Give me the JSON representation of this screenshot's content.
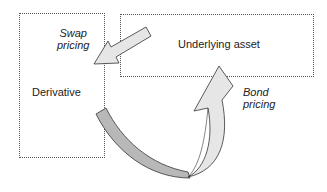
{
  "diagram": {
    "nodes": [
      {
        "id": "derivative",
        "label": "Derivative"
      },
      {
        "id": "underlying",
        "label": "Underlying asset"
      }
    ],
    "edges": [
      {
        "from": "underlying",
        "to": "derivative",
        "label_line1": "Swap",
        "label_line2": "pricing"
      },
      {
        "from": "derivative",
        "to": "underlying",
        "label_line1": "Bond",
        "label_line2": "pricing"
      }
    ],
    "colors": {
      "box_border": "#555555",
      "arrow_fill_light": "#e6e6e6",
      "arrow_fill_dark": "#b8b8b8",
      "arrow_stroke": "#333333"
    }
  }
}
